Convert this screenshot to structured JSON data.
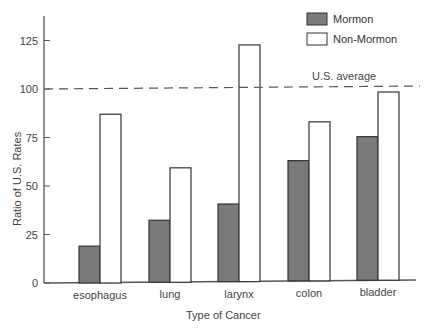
{
  "chart_data": {
    "type": "bar",
    "title": "",
    "xlabel": "Type of Cancer",
    "ylabel": "Ratio of U.S. Rates",
    "categories": [
      "esophagus",
      "lung",
      "larynx",
      "colon",
      "bladder"
    ],
    "series": [
      {
        "name": "Mormon",
        "values": [
          19,
          32,
          40,
          62,
          74
        ],
        "color": "#7a7a7a"
      },
      {
        "name": "Non-Mormon",
        "values": [
          87,
          59,
          122,
          82,
          97
        ],
        "color": "#ffffff"
      }
    ],
    "ylim": [
      0,
      135
    ],
    "yticks": [
      0,
      25,
      50,
      75,
      100,
      125
    ],
    "grid": false,
    "legend_position": "top-right",
    "annotations": [
      {
        "text": "U.S. average",
        "type": "reference-line",
        "y": 100,
        "style": "dashed"
      }
    ]
  },
  "legend": {
    "items": [
      {
        "label": "Mormon"
      },
      {
        "label": "Non-Mormon"
      }
    ]
  },
  "axes": {
    "x_title": "Type of Cancer",
    "y_title": "Ratio of U.S. Rates",
    "y_tick_labels": [
      "0",
      "25",
      "50",
      "75",
      "100",
      "125"
    ]
  },
  "reference_line": {
    "label": "U.S. average",
    "value": 100
  }
}
